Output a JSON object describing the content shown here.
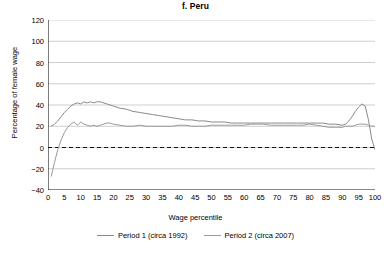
{
  "chart_data": {
    "type": "line",
    "title": "f. Peru",
    "xlabel": "Wage percentile",
    "ylabel": "Percentage of female wage",
    "xlim": [
      0,
      100
    ],
    "ylim": [
      -40,
      120
    ],
    "ytick_labels": [
      "120",
      "100",
      "80",
      "60",
      "40",
      "20",
      "0",
      "−20",
      "−40"
    ],
    "ytick_values": [
      120,
      100,
      80,
      60,
      40,
      20,
      0,
      -20,
      -40
    ],
    "xtick_labels": [
      "0",
      "5",
      "10",
      "15",
      "20",
      "25",
      "30",
      "35",
      "40",
      "45",
      "50",
      "55",
      "60",
      "65",
      "70",
      "75",
      "80",
      "85",
      "90",
      "95",
      "100"
    ],
    "xtick_values": [
      0,
      5,
      10,
      15,
      20,
      25,
      30,
      35,
      40,
      45,
      50,
      55,
      60,
      65,
      70,
      75,
      80,
      85,
      90,
      95,
      100
    ],
    "grid": "horizontal",
    "zero_reference_line": 0,
    "legend_position": "bottom",
    "series": [
      {
        "name": "Period 1 (circa 1992)",
        "color": "#8a8a8a",
        "x": [
          1,
          2,
          3,
          4,
          5,
          6,
          7,
          8,
          9,
          10,
          11,
          12,
          13,
          14,
          15,
          16,
          17,
          18,
          19,
          20,
          22,
          24,
          26,
          28,
          30,
          32,
          34,
          36,
          38,
          40,
          42,
          44,
          46,
          48,
          50,
          52,
          54,
          56,
          58,
          60,
          62,
          64,
          66,
          68,
          70,
          72,
          74,
          76,
          78,
          80,
          82,
          84,
          86,
          88,
          90,
          91,
          92,
          93,
          94,
          95,
          96,
          97,
          98,
          99,
          100
        ],
        "values": [
          20,
          22,
          25,
          29,
          33,
          36,
          39,
          41,
          42,
          41,
          43,
          42,
          43,
          42,
          43,
          43,
          42,
          41,
          40,
          39,
          37,
          36,
          34,
          33,
          32,
          31,
          30,
          29,
          28,
          27,
          26,
          26,
          25,
          25,
          24,
          24,
          24,
          23,
          23,
          23,
          23,
          23,
          23,
          23,
          23,
          23,
          23,
          23,
          23,
          23,
          23,
          23,
          22,
          22,
          21,
          22,
          25,
          29,
          34,
          38,
          41,
          39,
          26,
          8,
          -2
        ]
      },
      {
        "name": "Period 2 (circa 2007)",
        "color": "#9a9a9a",
        "x": [
          1,
          2,
          3,
          4,
          5,
          6,
          7,
          8,
          9,
          10,
          11,
          12,
          13,
          14,
          15,
          16,
          17,
          18,
          19,
          20,
          22,
          24,
          26,
          28,
          30,
          32,
          34,
          36,
          38,
          40,
          42,
          44,
          46,
          48,
          50,
          52,
          54,
          56,
          58,
          60,
          62,
          64,
          66,
          68,
          70,
          72,
          74,
          76,
          78,
          80,
          82,
          84,
          86,
          88,
          90,
          91,
          92,
          93,
          94,
          95,
          96,
          97,
          98,
          99,
          100
        ],
        "values": [
          -27,
          -14,
          -2,
          7,
          14,
          19,
          22,
          24,
          21,
          24,
          22,
          21,
          20,
          21,
          20,
          21,
          22,
          23,
          23,
          22,
          21,
          20,
          20,
          21,
          20,
          20,
          20,
          20,
          20,
          21,
          21,
          20,
          20,
          20,
          21,
          21,
          21,
          21,
          21,
          21,
          22,
          22,
          22,
          21,
          21,
          21,
          21,
          21,
          21,
          22,
          21,
          20,
          19,
          19,
          19,
          20,
          20,
          20,
          21,
          22,
          22,
          22,
          21,
          20,
          20
        ]
      }
    ]
  }
}
